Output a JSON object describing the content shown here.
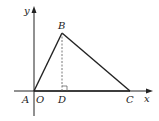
{
  "diagram": {
    "type": "coordinate-geometry",
    "axes": {
      "x_label": "x",
      "y_label": "y",
      "origin_label": "O"
    },
    "points": {
      "A": "A",
      "B": "B",
      "C": "C",
      "D": "D"
    },
    "colors": {
      "line": "#222222",
      "dashed": "#555555",
      "background": "#ffffff"
    }
  }
}
